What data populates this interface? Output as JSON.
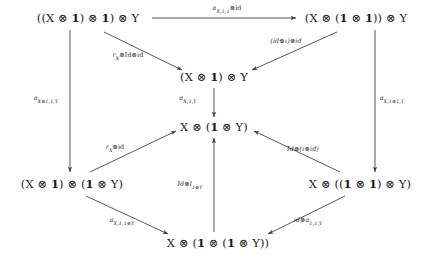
{
  "diagram": {
    "type": "commutative-diagram",
    "nodes": [
      {
        "id": "top-left",
        "label": "((X ⊗ 1) ⊗ 1) ⊗ Y",
        "x": 88,
        "y": 18
      },
      {
        "id": "top-right",
        "label": "(X ⊗ (1 ⊗ 1)) ⊗ Y",
        "x": 356,
        "y": 18
      },
      {
        "id": "upper-middle",
        "label": "(X ⊗ 1) ⊗ Y",
        "x": 214,
        "y": 77
      },
      {
        "id": "center",
        "label": "X ⊗ (1 ⊗ Y)",
        "x": 214,
        "y": 127
      },
      {
        "id": "bottom-left",
        "label": "(X ⊗ 1) ⊗ (1 ⊗ Y)",
        "x": 72,
        "y": 184
      },
      {
        "id": "bottom-right",
        "label": "X ⊗ ((1 ⊗ 1) ⊗ Y)",
        "x": 360,
        "y": 184
      },
      {
        "id": "bottom-center",
        "label": "X ⊗ (1 ⊗ (1 ⊗ Y))",
        "x": 218,
        "y": 243
      }
    ],
    "arrows": [
      {
        "id": "top-horizontal",
        "from": "top-left",
        "to": "top-right",
        "label": "a",
        "sub": "X,1,1",
        "suffix": "⊗id",
        "lx": 227,
        "ly": 9
      },
      {
        "id": "topleft-to-middle",
        "from": "top-left",
        "to": "upper-middle",
        "label": "r",
        "sub": "X",
        "suffix": "⊗Id⊗id",
        "lx": 128,
        "ly": 56
      },
      {
        "id": "topright-to-middle",
        "from": "top-right",
        "to": "upper-middle",
        "label": "(id⊗ι)⊗id",
        "sub": "",
        "suffix": "",
        "lx": 286,
        "ly": 42
      },
      {
        "id": "left-vertical",
        "from": "top-left",
        "to": "bottom-left",
        "label": "a",
        "sub": "X⊗1,1,Y",
        "suffix": "",
        "lx": 46,
        "ly": 99
      },
      {
        "id": "middle-vertical",
        "from": "upper-middle",
        "to": "center",
        "label": "a",
        "sub": "X,1,Y",
        "suffix": "",
        "lx": 188,
        "ly": 99
      },
      {
        "id": "right-vertical",
        "from": "top-right",
        "to": "bottom-right",
        "label": "a",
        "sub": "X,1⊗1,Y",
        "suffix": "",
        "lx": 392,
        "ly": 99
      },
      {
        "id": "bottomleft-to-center",
        "from": "bottom-left",
        "to": "center",
        "label": "r",
        "sub": "X",
        "suffix": "⊗id",
        "lx": 115,
        "ly": 148
      },
      {
        "id": "bottomright-to-center",
        "from": "bottom-right",
        "to": "center",
        "label": "Id⊗(ι⊗id)",
        "sub": "",
        "suffix": "",
        "lx": 303,
        "ly": 150
      },
      {
        "id": "bottomcenter-to-center",
        "from": "bottom-center",
        "to": "center",
        "label": "Id⊗l",
        "sub": "1⊗Y",
        "suffix": "",
        "lx": 190,
        "ly": 185
      },
      {
        "id": "bottomleft-to-bottom",
        "from": "bottom-left",
        "to": "bottom-center",
        "label": "a",
        "sub": "X,1,1⊗Y",
        "suffix": "",
        "lx": 122,
        "ly": 221
      },
      {
        "id": "bottomright-to-bottom",
        "from": "bottom-right",
        "to": "bottom-center",
        "label": "id⊗a",
        "sub": "1,1,Y",
        "suffix": "",
        "lx": 308,
        "ly": 221
      }
    ]
  },
  "colors": {
    "background": "#ffffff",
    "stroke": "#3a3a3a",
    "text": "#1a1a1a"
  }
}
